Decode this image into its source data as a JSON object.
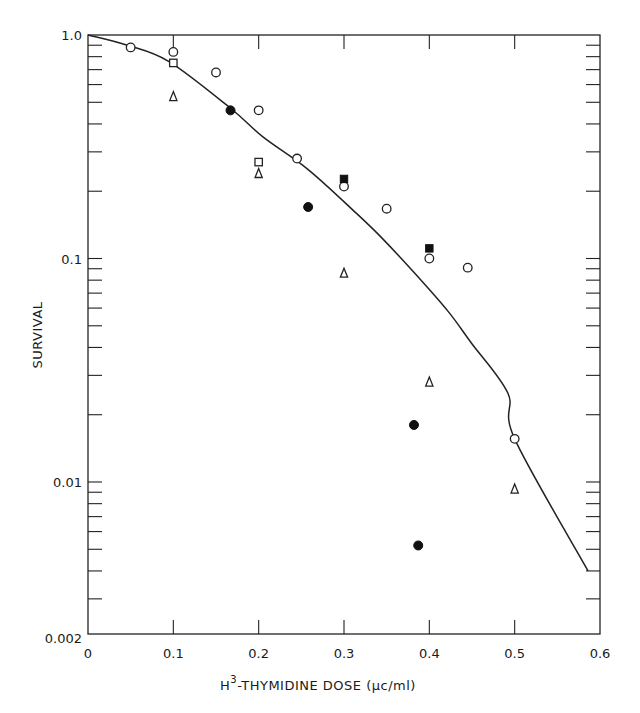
{
  "chart_data": {
    "type": "scatter",
    "title": "",
    "xlabel": "H3-THYMIDINE DOSE (μc/ml)",
    "xlabel_parts": {
      "prefix": "H",
      "superscript": "3",
      "suffix": "-THYMIDINE  DOSE (μc/ml)"
    },
    "ylabel": "SURVIVAL",
    "xscale": "linear",
    "yscale": "log",
    "xlim": [
      0,
      0.6
    ],
    "ylim": [
      0.002,
      1.0
    ],
    "grid": false,
    "legend": null,
    "x_ticks": [
      0,
      0.1,
      0.2,
      0.3,
      0.4,
      0.5,
      0.6
    ],
    "x_tick_labels": [
      "0",
      "0.1",
      "0.2",
      "0.3",
      "0.4",
      "0.5",
      "0.6"
    ],
    "y_ticks": [
      1.0,
      0.1,
      0.01,
      0.002
    ],
    "y_tick_labels": [
      "1.0",
      "0.1",
      "0.01",
      "0.002"
    ],
    "y_minor_ticks": [
      0.9,
      0.8,
      0.7,
      0.6,
      0.5,
      0.4,
      0.3,
      0.2,
      0.09,
      0.08,
      0.07,
      0.06,
      0.05,
      0.04,
      0.03,
      0.02,
      0.009,
      0.008,
      0.007,
      0.006,
      0.005,
      0.004,
      0.003
    ],
    "series": [
      {
        "name": "open circles",
        "marker": "circle-open",
        "points": [
          [
            0.05,
            0.88
          ],
          [
            0.1,
            0.84
          ],
          [
            0.15,
            0.68
          ],
          [
            0.2,
            0.46
          ],
          [
            0.245,
            0.28
          ],
          [
            0.3,
            0.21
          ],
          [
            0.35,
            0.167
          ],
          [
            0.4,
            0.1
          ],
          [
            0.445,
            0.091
          ],
          [
            0.5,
            0.0156
          ]
        ]
      },
      {
        "name": "filled circles",
        "marker": "circle-filled",
        "points": [
          [
            0.167,
            0.46
          ],
          [
            0.258,
            0.17
          ],
          [
            0.382,
            0.018
          ],
          [
            0.387,
            0.0052
          ]
        ]
      },
      {
        "name": "open squares",
        "marker": "square-open",
        "points": [
          [
            0.1,
            0.75
          ],
          [
            0.2,
            0.27
          ]
        ]
      },
      {
        "name": "filled squares",
        "marker": "square-filled",
        "points": [
          [
            0.3,
            0.227
          ],
          [
            0.4,
            0.111
          ]
        ]
      },
      {
        "name": "open triangles",
        "marker": "triangle-open",
        "points": [
          [
            0.1,
            0.53
          ],
          [
            0.2,
            0.24
          ],
          [
            0.3,
            0.086
          ],
          [
            0.4,
            0.028
          ],
          [
            0.5,
            0.0093
          ]
        ]
      }
    ],
    "fit_curve": {
      "name": "fitted survival curve",
      "points": [
        [
          0.0,
          1.0
        ],
        [
          0.046,
          0.9
        ],
        [
          0.095,
          0.76
        ],
        [
          0.167,
          0.47
        ],
        [
          0.205,
          0.35
        ],
        [
          0.258,
          0.25
        ],
        [
          0.314,
          0.16
        ],
        [
          0.344,
          0.124
        ],
        [
          0.384,
          0.085
        ],
        [
          0.422,
          0.058
        ],
        [
          0.449,
          0.042
        ],
        [
          0.492,
          0.025
        ],
        [
          0.5,
          0.0156
        ],
        [
          0.586,
          0.004
        ]
      ]
    }
  }
}
